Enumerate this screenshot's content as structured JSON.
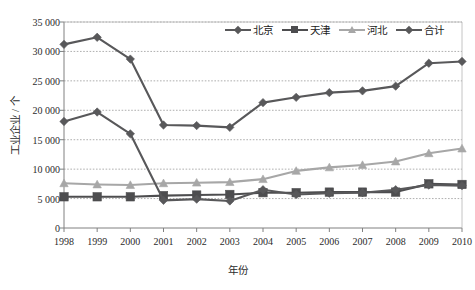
{
  "chart_data": {
    "type": "line",
    "title": "",
    "xlabel": "年份",
    "ylabel": "工业企业 / 个",
    "x": [
      1998,
      1999,
      2000,
      2001,
      2002,
      2003,
      2004,
      2005,
      2006,
      2007,
      2008,
      2009,
      2010
    ],
    "categories": [
      "1998",
      "1999",
      "2000",
      "2001",
      "2002",
      "2003",
      "2004",
      "2005",
      "2006",
      "2007",
      "2008",
      "2009",
      "2010"
    ],
    "ylim": [
      0,
      35000
    ],
    "ytick_step": 5000,
    "yticks": [
      0,
      5000,
      10000,
      15000,
      20000,
      25000,
      30000,
      35000
    ],
    "ytick_labels": [
      "0",
      "5 000",
      "10 000",
      "15 000",
      "20 000",
      "25 000",
      "30 000",
      "35 000"
    ],
    "grid": true,
    "legend_position": "top-right",
    "series": [
      {
        "name": "北京",
        "marker": "diamond",
        "color": "#58585a",
        "values": [
          18100,
          19700,
          16000,
          4700,
          4900,
          4600,
          6500,
          5700,
          5900,
          6000,
          6500,
          7300,
          7200
        ]
      },
      {
        "name": "天津",
        "marker": "square",
        "color": "#4d4d4f",
        "values": [
          5300,
          5300,
          5300,
          5500,
          5600,
          5700,
          6000,
          6000,
          6100,
          6100,
          6100,
          7500,
          7400
        ]
      },
      {
        "name": "河北",
        "marker": "triangle",
        "color": "#a7a7a7",
        "values": [
          7600,
          7400,
          7300,
          7600,
          7700,
          7800,
          8300,
          9700,
          10300,
          10700,
          11300,
          12700,
          13500
        ]
      },
      {
        "name": "合计",
        "marker": "diamond",
        "color": "#58585a",
        "values": [
          31200,
          32400,
          28700,
          17500,
          17400,
          17100,
          21300,
          22200,
          23000,
          23300,
          24100,
          28000,
          28300
        ]
      }
    ]
  }
}
